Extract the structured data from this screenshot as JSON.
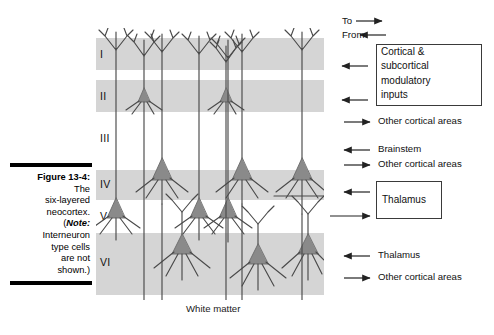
{
  "figure": {
    "caption_number": "Figure 13-4:",
    "caption_line2": "The",
    "caption_line3": "six-layered",
    "caption_line4": "neocortex.",
    "caption_note_open": "(",
    "caption_note_label": "Note:",
    "caption_line5": "Interneuron",
    "caption_line6": "type cells",
    "caption_line7": "are not",
    "caption_line8": "shown.)"
  },
  "cortex": {
    "layers": [
      {
        "label": "I"
      },
      {
        "label": "II"
      },
      {
        "label": "III"
      },
      {
        "label": "IV"
      },
      {
        "label": "V"
      },
      {
        "label": "VI"
      }
    ],
    "white_matter_label": "White matter",
    "band_color": "#d5d5d5",
    "soma_color": "#8a8a8a",
    "process_color": "#4a4a4a"
  },
  "legend": {
    "direction_to": "To",
    "direction_from": "From",
    "entries": [
      {
        "label": "Cortical & subcortical modulatory inputs",
        "boxed": "true"
      },
      {
        "label": "Other cortical areas",
        "direction": "to"
      },
      {
        "label": "Brainstem",
        "direction": "from"
      },
      {
        "label": "Other cortical areas",
        "direction": "to"
      },
      {
        "label": "Thalamus",
        "boxed": "true"
      },
      {
        "label": "Thalamus",
        "direction": "from"
      },
      {
        "label": "Other cortical areas",
        "direction": "to"
      }
    ],
    "box1_line1": "Cortical &",
    "box1_line2": "subcortical",
    "box1_line3": "modulatory",
    "box1_line4": "inputs",
    "text_other_cortical_1": "Other cortical areas",
    "text_brainstem": "Brainstem",
    "text_other_cortical_2": "Other cortical areas",
    "box2_label": "Thalamus",
    "text_thalamus": "Thalamus",
    "text_other_cortical_3": "Other cortical areas"
  }
}
